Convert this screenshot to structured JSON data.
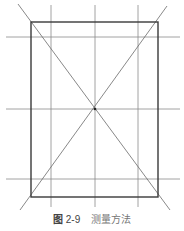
{
  "figure": {
    "caption": {
      "label": "图",
      "number": "2-9",
      "title": "测量方法"
    },
    "colors": {
      "rect": "#3a3a3a",
      "grid": "#8a8a8a",
      "diag": "#6a6a6a"
    },
    "rect": {
      "x1": 31,
      "y1": 22,
      "x2": 158,
      "y2": 197
    },
    "vertical_lines": [
      51,
      95,
      138
    ],
    "horizontal_lines": [
      37,
      109,
      179
    ],
    "center": {
      "x": 95,
      "y": 109
    }
  }
}
